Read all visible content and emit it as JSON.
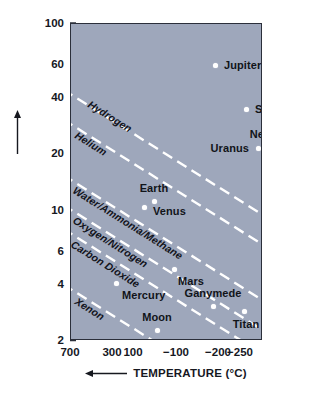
{
  "chart_data": {
    "type": "scatter",
    "title": "",
    "xlabel": "TEMPERATURE (°C)",
    "ylabel": "SPEED (km/s)",
    "xlabel_arrow": "←",
    "ylabel_arrow": "↑",
    "x_axis": {
      "scale": "linear-reversed",
      "tick_labels": [
        "700",
        "300",
        "100",
        "−100",
        "−200",
        "−250"
      ],
      "tick_values": [
        700,
        300,
        100,
        -100,
        -200,
        -250
      ],
      "tick_px": [
        0,
        42,
        63,
        106,
        148,
        170
      ],
      "direction": "decreasing left to right"
    },
    "y_axis": {
      "scale": "log",
      "tick_labels": [
        "100",
        "60",
        "40",
        "20",
        "10",
        "6",
        "4",
        "2"
      ],
      "tick_values": [
        100,
        60,
        40,
        20,
        10,
        6,
        4,
        2
      ],
      "ylim": [
        2,
        100
      ],
      "unit": "km/s"
    },
    "grid": false,
    "legend": "inline-line-labels",
    "points": [
      {
        "name": "Jupiter",
        "x_px": 144,
        "y_px": 41,
        "label_dx": 9,
        "label_dy": 0,
        "label_align": "left",
        "temperature_c": -150,
        "speed_km_s": 60
      },
      {
        "name": "Saturn",
        "x_px": 175,
        "y_px": 85,
        "label_dx": 9,
        "label_dy": 0,
        "label_align": "left",
        "temperature_c": -180,
        "speed_km_s": 36
      },
      {
        "name": "Neptune",
        "x_px": 198,
        "y_px": 123,
        "label_dx": 3,
        "label_dy": -13,
        "label_align": "center",
        "temperature_c": -220,
        "speed_km_s": 24
      },
      {
        "name": "Uranus",
        "x_px": 187,
        "y_px": 124,
        "label_dx": -9,
        "label_dy": 0,
        "label_align": "right",
        "temperature_c": -210,
        "speed_km_s": 22
      },
      {
        "name": "Earth",
        "x_px": 83,
        "y_px": 177,
        "label_dx": 0,
        "label_dy": -13,
        "label_align": "center",
        "temperature_c": 15,
        "speed_km_s": 11.2
      },
      {
        "name": "Venus",
        "x_px": 73,
        "y_px": 183,
        "label_dx": 9,
        "label_dy": 4,
        "label_align": "left",
        "temperature_c": 30,
        "speed_km_s": 10.4
      },
      {
        "name": "Mars",
        "x_px": 103,
        "y_px": 245,
        "label_dx": 4,
        "label_dy": 12,
        "label_align": "left",
        "temperature_c": -60,
        "speed_km_s": 5
      },
      {
        "name": "Mercury",
        "x_px": 45,
        "y_px": 259,
        "label_dx": 6,
        "label_dy": 12,
        "label_align": "left",
        "temperature_c": 200,
        "speed_km_s": 4.2
      },
      {
        "name": "Ganymede",
        "x_px": 142,
        "y_px": 282,
        "label_dx": 0,
        "label_dy": -13,
        "label_align": "center",
        "temperature_c": -150,
        "speed_km_s": 3.3
      },
      {
        "name": "Titan",
        "x_px": 173,
        "y_px": 287,
        "label_dx": 2,
        "label_dy": 13,
        "label_align": "center",
        "temperature_c": -180,
        "speed_km_s": 3.1
      },
      {
        "name": "Triton",
        "x_px": 207,
        "y_px": 282,
        "label_dx": 0,
        "label_dy": -13,
        "label_align": "center",
        "temperature_c": -235,
        "speed_km_s": 3.3
      },
      {
        "name": "Moon",
        "x_px": 86,
        "y_px": 306,
        "label_dx": 0,
        "label_dy": -13,
        "label_align": "center",
        "temperature_c": 120,
        "speed_km_s": 2.4
      }
    ],
    "retention_lines": [
      {
        "gas": "Hydrogen",
        "x1": -8,
        "y1": 66,
        "x2": 200,
        "y2": 196,
        "label": "Hydrogen",
        "label_x": 18,
        "label_y": 73
      },
      {
        "gas": "Helium",
        "x1": -8,
        "y1": 96,
        "x2": 200,
        "y2": 226,
        "label": "Helium",
        "label_x": 5,
        "label_y": 104
      },
      {
        "gas": "Water/Ammonia/Methane",
        "x1": -8,
        "y1": 152,
        "x2": 200,
        "y2": 282,
        "label": "Water/Ammonia/Methane",
        "label_x": 3,
        "label_y": 159
      },
      {
        "gas": "Oxygen/Nitrogen",
        "x1": -8,
        "y1": 182,
        "x2": 200,
        "y2": 312,
        "label": "Oxygen/Nitrogen",
        "label_x": 3,
        "label_y": 189
      },
      {
        "gas": "Carbon Dioxide",
        "x1": -8,
        "y1": 206,
        "x2": 200,
        "y2": 336,
        "label": "Carbon Dioxide",
        "label_x": 1,
        "label_y": 213
      },
      {
        "gas": "Xenon",
        "x1": -8,
        "y1": 262,
        "x2": 200,
        "y2": 392,
        "label": "Xenon",
        "label_x": 5,
        "label_y": 270
      }
    ],
    "colors": {
      "plot_background": "#9ea7bb",
      "line": "#ffffff",
      "point": "#ffffff",
      "text": "#16181f",
      "frame": "#2b2f3a",
      "page_background": "#ffffff"
    }
  }
}
